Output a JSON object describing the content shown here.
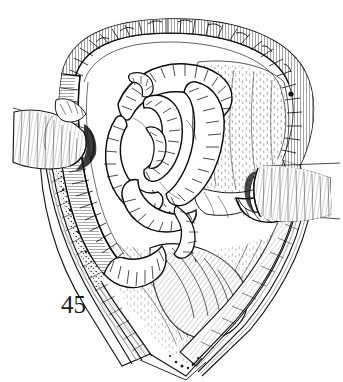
{
  "plate": {
    "figure_number": "45",
    "background_color": "#ffffff",
    "ink_color": "#111111",
    "medium": "pen-and-ink line engraving",
    "subject": "surgical illustration: abdominal laparotomy wound held open by retractors, exposing colon and coils of small intestine"
  },
  "illustration": {
    "regions": [
      {
        "name": "colon-arch",
        "label": "Transverse and ascending colon arching over the wound",
        "description": "Thick tubular loop sweeping across the top and down the right side, drawn with dense cross-hatched haustral striations"
      },
      {
        "name": "small-intestine-coils",
        "label": "Coils of small intestine",
        "description": "Tangled mass of tubular loops occupying the left-centre of the opening, each loop hatched with fine perpendicular strokes"
      },
      {
        "name": "mesentery-omentum",
        "label": "Mesentery and omental fat",
        "description": "Pale fan-shaped sheet stippled with short broken strokes, filling the right-centre of the field"
      },
      {
        "name": "wound-edge-left",
        "label": "Left cut edge of abdominal wall",
        "description": "Layered strip of skin, fat and muscle with dark granular stipple indicating divided tissue"
      },
      {
        "name": "wound-edge-right",
        "label": "Right cut edge of abdominal wall",
        "description": "Layered strip descending to the apex of the incision"
      },
      {
        "name": "incision-apex",
        "label": "Lower apex of the incision",
        "description": "V-shaped convergence of the wound edges at the bottom of the plate"
      },
      {
        "name": "retractor-left",
        "label": "Left retractor blade",
        "description": "Smooth ribbed blade entering from the left margin, holding the wound edge outward"
      },
      {
        "name": "retractor-right",
        "label": "Right retractor blade",
        "description": "Smooth ribbed blade entering from the right margin with two thin handle shafts running to the plate edge"
      }
    ]
  }
}
